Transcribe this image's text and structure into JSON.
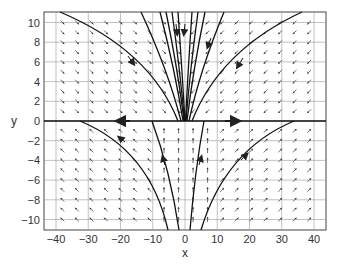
{
  "chart_data": {
    "type": "vector_field_phase_portrait",
    "title": "",
    "xlabel": "x",
    "ylabel": "y",
    "xlim": [
      -44,
      44
    ],
    "ylim": [
      -11,
      11
    ],
    "grid": true,
    "xticks": [
      -40,
      -30,
      -20,
      -10,
      0,
      10,
      20,
      30,
      40
    ],
    "yticks": [
      10,
      8,
      6,
      4,
      2,
      0,
      -2,
      -4,
      -6,
      -8,
      -10
    ],
    "x_tick_labels": [
      "-40",
      "-30",
      "-20",
      "-10",
      "0",
      "10",
      "20",
      "30",
      "40"
    ],
    "y_tick_labels": [
      "10",
      "8",
      "6",
      "4",
      "2",
      "0",
      "-2",
      "-4",
      "-6",
      "-8",
      "-10"
    ],
    "field_directions": {
      "upper_left": "down-right",
      "upper_right": "down-left",
      "lower_left": "up-left",
      "lower_right": "up-right",
      "lower_center": "up"
    },
    "invariant_line": {
      "y": 0,
      "arrow_directions": [
        "left",
        "right"
      ]
    },
    "trajectories_upper": [
      {
        "from": [
          -38,
          11
        ],
        "to": [
          -2,
          0
        ]
      },
      {
        "from": [
          -13,
          11
        ],
        "to": [
          -1,
          0
        ]
      },
      {
        "from": [
          -6,
          11
        ],
        "to": [
          -0.5,
          0
        ]
      },
      {
        "from": [
          6,
          11
        ],
        "to": [
          0.5,
          0
        ]
      },
      {
        "from": [
          12,
          11
        ],
        "to": [
          1,
          0
        ]
      },
      {
        "from": [
          35,
          11
        ],
        "to": [
          2,
          0
        ]
      }
    ],
    "trajectories_lower": [
      {
        "from": [
          -2,
          -11
        ],
        "to": [
          -33,
          0
        ]
      },
      {
        "from": [
          -1,
          -11
        ],
        "to": [
          -10,
          0
        ]
      },
      {
        "from": [
          1,
          -11
        ],
        "to": [
          2,
          0
        ]
      },
      {
        "from": [
          5,
          -11
        ],
        "to": [
          33,
          0
        ]
      }
    ]
  }
}
